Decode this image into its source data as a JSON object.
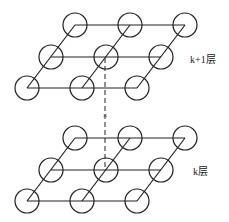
{
  "diagram": {
    "layers": [
      {
        "name": "upper-layer",
        "label": "k+1层",
        "rows": 3,
        "cols": 3
      },
      {
        "name": "lower-layer",
        "label": "k层",
        "rows": 3,
        "cols": 3
      }
    ],
    "connector": {
      "style": "dashed",
      "marker": "×"
    },
    "colors": {
      "stroke": "#222222",
      "background": "#ffffff"
    }
  }
}
